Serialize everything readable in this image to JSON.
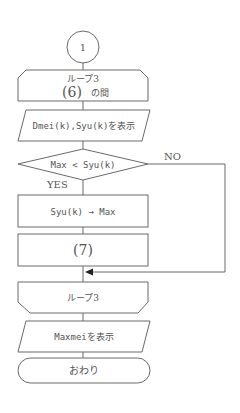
{
  "flowchart": {
    "connector": {
      "label": "1"
    },
    "loop_start": {
      "title": "ループ3",
      "condition_blank": "(6)",
      "condition_suffix": "の間"
    },
    "display_1": {
      "label": "Dmei(k),Syu(k)を表示"
    },
    "decision": {
      "label": "Max < Syu(k)",
      "yes_label": "YES",
      "no_label": "NO"
    },
    "process_1": {
      "label": "Syu(k) → Max"
    },
    "process_2": {
      "label": "(7)"
    },
    "loop_end": {
      "title": "ループ3"
    },
    "display_2": {
      "label": "Maxmeiを表示"
    },
    "terminal": {
      "label": "おわり"
    }
  },
  "colors": {
    "stroke": "#6a6a6a",
    "text": "#555555",
    "background": "#ffffff"
  }
}
